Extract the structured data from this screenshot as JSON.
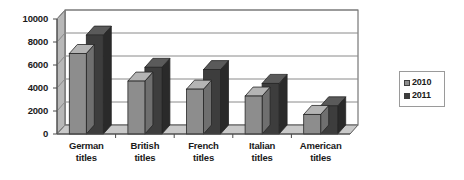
{
  "chart_data": {
    "type": "bar",
    "title": "",
    "xlabel": "",
    "ylabel": "",
    "ylim": [
      0,
      10000
    ],
    "yticks": [
      0,
      2000,
      4000,
      6000,
      8000,
      10000
    ],
    "ytick_labels": [
      "0",
      "2000",
      "4000",
      "6000",
      "8000",
      "10000"
    ],
    "grid": true,
    "legend_position": "right",
    "style": "3d-column",
    "categories": [
      "German titles",
      "British titles",
      "French titles",
      "Italian titles",
      "American titles"
    ],
    "category_lines": [
      [
        "German",
        "titles"
      ],
      [
        "British",
        "titles"
      ],
      [
        "French",
        "titles"
      ],
      [
        "Italian",
        "titles"
      ],
      [
        "American",
        "titles"
      ]
    ],
    "series": [
      {
        "name": "2010",
        "color": "#8d8d8d",
        "values": [
          7000,
          4600,
          3900,
          3300,
          1700
        ]
      },
      {
        "name": "2011",
        "color": "#3d3d3d",
        "values": [
          8600,
          5800,
          5600,
          4400,
          2450
        ]
      }
    ]
  },
  "legend": {
    "items": [
      {
        "label": "2010",
        "color": "#8d8d8d"
      },
      {
        "label": "2011",
        "color": "#3d3d3d"
      }
    ]
  },
  "colors": {
    "series_2010_front": "#8d8d8d",
    "series_2010_top": "#b4b4b4",
    "series_2010_side": "#6f6f6f",
    "series_2011_front": "#3d3d3d",
    "series_2011_top": "#5a5a5a",
    "series_2011_side": "#2a2a2a",
    "plot_border": "#5a5a5a",
    "gridline": "#8a8a8a",
    "floor": "#c9c9c9",
    "wall": "#b8b8b8",
    "text": "#1a1a1a"
  }
}
